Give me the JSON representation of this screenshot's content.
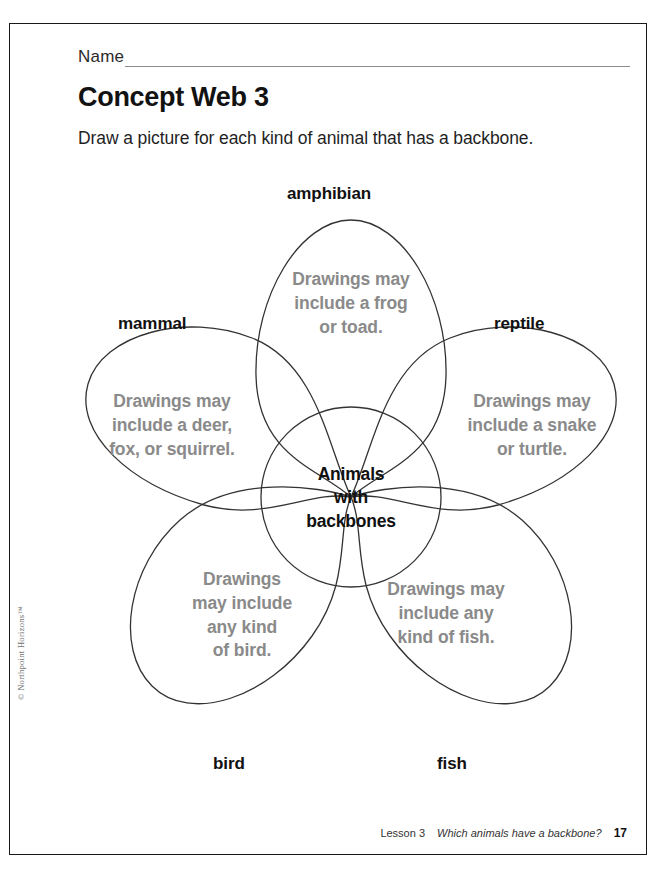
{
  "header": {
    "name_label": "Name",
    "title": "Concept Web 3",
    "instruction": "Draw a picture for each kind of animal that has a backbone."
  },
  "web": {
    "center": {
      "label": "Animals with backbones",
      "lines": [
        "Animals",
        "with",
        "backbones"
      ]
    },
    "petals": [
      {
        "id": "amphibian",
        "label": "amphibian",
        "answer": "Drawings may include a frog or toad.",
        "lines": [
          "Drawings may",
          "include a frog",
          "or toad."
        ]
      },
      {
        "id": "mammal",
        "label": "mammal",
        "answer": "Drawings may include a deer, fox, or squirrel.",
        "lines": [
          "Drawings may",
          "include a deer,",
          "fox, or squirrel."
        ]
      },
      {
        "id": "reptile",
        "label": "reptile",
        "answer": "Drawings may include a snake or turtle.",
        "lines": [
          "Drawings may",
          "include a snake",
          "or turtle."
        ]
      },
      {
        "id": "bird",
        "label": "bird",
        "answer": "Drawings may include any kind of bird.",
        "lines": [
          "Drawings",
          "may include",
          "any kind",
          "of bird."
        ]
      },
      {
        "id": "fish",
        "label": "fish",
        "answer": "Drawings may include any kind of fish.",
        "lines": [
          "Drawings may",
          "include any",
          "kind of fish."
        ]
      }
    ]
  },
  "copyright": "© Northpoint Horizons™",
  "footer": {
    "lesson": "Lesson 3",
    "description": "Which animals have a backbone?",
    "page_number": "17"
  },
  "colors": {
    "answer_text": "#8a8a8a",
    "label_text": "#111111",
    "outline": "#333333",
    "border": "#1a1a1a"
  }
}
